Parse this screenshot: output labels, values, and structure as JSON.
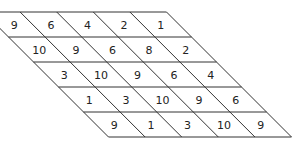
{
  "diagram": {
    "type": "slanted-number-grid",
    "rows": 5,
    "cols": 5,
    "cells": [
      [
        9,
        6,
        4,
        2,
        1
      ],
      [
        10,
        9,
        6,
        8,
        2
      ],
      [
        3,
        10,
        9,
        6,
        4
      ],
      [
        1,
        3,
        10,
        9,
        6
      ],
      [
        9,
        1,
        3,
        10,
        9
      ]
    ],
    "colors": {
      "line": "#333333",
      "text": "#222222",
      "background": "#ffffff"
    }
  }
}
